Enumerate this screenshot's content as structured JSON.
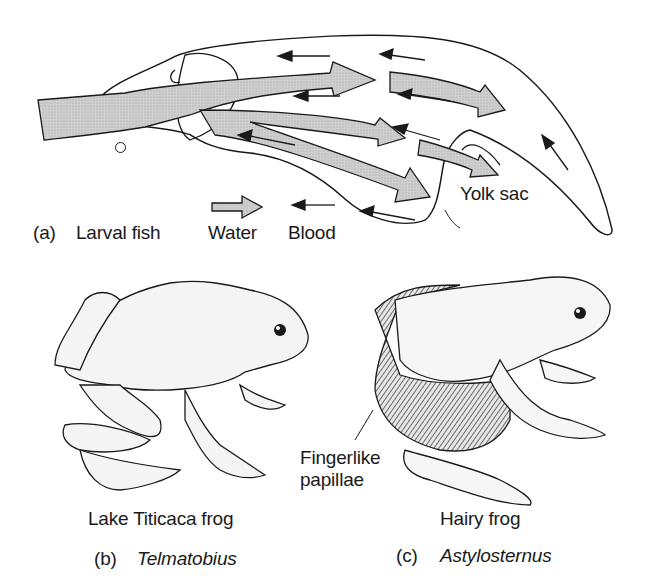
{
  "panel_a": {
    "letter": "(a)",
    "title": "Larval fish",
    "callout": "Yolk sac",
    "legend": {
      "water_label": "Water",
      "blood_label": "Blood",
      "water_icon": "thick-gray-arrow-right",
      "blood_icon": "thin-black-arrow-left"
    },
    "colors": {
      "water_fill": "#c8c8c8",
      "outline": "#1a1a1a"
    }
  },
  "panel_b": {
    "common_name": "Lake Titicaca frog",
    "letter": "(b)",
    "genus": "Telmatobius"
  },
  "panel_c": {
    "common_name": "Hairy frog",
    "letter": "(c)",
    "genus": "Astylosternus",
    "callout_line1": "Fingerlike",
    "callout_line2": "papillae"
  }
}
